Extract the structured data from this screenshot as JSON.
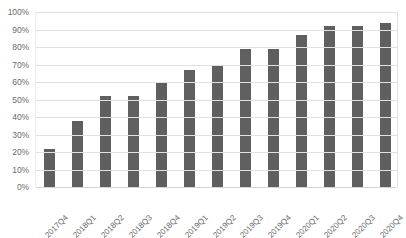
{
  "chart_data": {
    "type": "bar",
    "title": "",
    "subtitle": "",
    "xlabel": "",
    "ylabel": "",
    "categories": [
      "2017Q4",
      "2018Q1",
      "2018Q2",
      "2018Q3",
      "2018Q4",
      "2019Q1",
      "2019Q2",
      "2019Q3",
      "2019Q4",
      "2020Q1",
      "2020Q2",
      "2020Q3",
      "2020Q4"
    ],
    "values": [
      22,
      38,
      52,
      52,
      60,
      67,
      69,
      79,
      79,
      87,
      92,
      92,
      94
    ],
    "value_unit": "%",
    "ylim": [
      0,
      100
    ],
    "ytick_values": [
      0,
      10,
      20,
      30,
      40,
      50,
      60,
      70,
      80,
      90,
      100
    ],
    "ytick_labels": [
      "0%",
      "10%",
      "20%",
      "30%",
      "40%",
      "50%",
      "60%",
      "70%",
      "80%",
      "90%",
      "100%"
    ],
    "grid": true,
    "grid_axis": "y",
    "legend": false,
    "legend_position": "none",
    "series": [
      {
        "name": "",
        "values": [
          22,
          38,
          52,
          52,
          60,
          67,
          69,
          79,
          79,
          87,
          92,
          92,
          94
        ]
      }
    ],
    "colors": {
      "bar": "#5f5f5f",
      "gridline": "#e0e0e0",
      "axis_text": "#6b6b6b",
      "background": "#ffffff",
      "plot_border": "#e2e2e2"
    },
    "xtick_rotation": -45
  }
}
